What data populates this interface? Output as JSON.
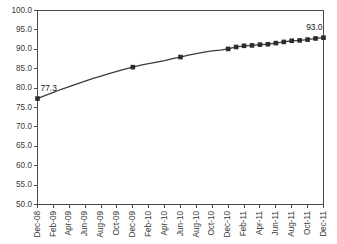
{
  "chart_data": {
    "type": "line",
    "title": "",
    "subtitle": "",
    "xlabel": "",
    "ylabel": "",
    "ylim": [
      50.0,
      100.0
    ],
    "ytick_step": 5.0,
    "ytick_labels": [
      "100.0",
      "95.0",
      "90.0",
      "85.0",
      "80.0",
      "75.0",
      "70.0",
      "65.0",
      "60.0",
      "55.0",
      "50.0"
    ],
    "ytick_values": [
      100.0,
      95.0,
      90.0,
      85.0,
      80.0,
      75.0,
      70.0,
      65.0,
      60.0,
      55.0,
      50.0
    ],
    "grid": false,
    "legend": false,
    "legend_position": "none",
    "x": [
      "Dec-08",
      "Jan-09",
      "Feb-09",
      "Mar-09",
      "Apr-09",
      "May-09",
      "Jun-09",
      "Jul-09",
      "Aug-09",
      "Sep-09",
      "Oct-09",
      "Nov-09",
      "Dec-09",
      "Jan-10",
      "Feb-10",
      "Mar-10",
      "Apr-10",
      "May-10",
      "Jun-10",
      "Jul-10",
      "Aug-10",
      "Sep-10",
      "Oct-10",
      "Nov-10",
      "Dec-10",
      "Jan-11",
      "Feb-11",
      "Mar-11",
      "Apr-11",
      "May-11",
      "Jun-11",
      "Jul-11",
      "Aug-11",
      "Sep-11",
      "Oct-11",
      "Nov-11",
      "Dec-11"
    ],
    "xtick_labels": [
      "Dec-08",
      "Feb-09",
      "Apr-09",
      "Jun-09",
      "Aug-09",
      "Oct-09",
      "Dec-09",
      "Feb-10",
      "Apr-10",
      "Jun-10",
      "Aug-10",
      "Oct-10",
      "Dec-10",
      "Feb-11",
      "Apr-11",
      "Jun-11",
      "Aug-11",
      "Oct-11",
      "Dec-11"
    ],
    "xtick_indices": [
      0,
      2,
      4,
      6,
      8,
      10,
      12,
      14,
      16,
      18,
      20,
      22,
      24,
      26,
      28,
      30,
      32,
      34,
      36
    ],
    "values": [
      77.3,
      78.1,
      78.9,
      79.7,
      80.4,
      81.1,
      81.8,
      82.5,
      83.1,
      83.7,
      84.3,
      84.9,
      85.4,
      85.9,
      86.3,
      86.7,
      87.1,
      87.6,
      88.0,
      88.5,
      88.9,
      89.3,
      89.6,
      89.8,
      90.1,
      90.6,
      90.9,
      91.0,
      91.2,
      91.3,
      91.6,
      91.9,
      92.2,
      92.3,
      92.5,
      92.8,
      93.0
    ],
    "marker_indices": [
      0,
      12,
      18,
      24,
      25,
      26,
      27,
      28,
      29,
      30,
      31,
      32,
      33,
      34,
      35,
      36
    ],
    "annotations": [
      {
        "name": "first-point-label",
        "text": "77.3",
        "index": 0,
        "value": 77.3
      },
      {
        "name": "last-point-label",
        "text": "93.0",
        "index": 36,
        "value": 93.0
      }
    ],
    "colors": {
      "line": "#3c3c3c",
      "marker": "#2b2b2b",
      "axis": "#4a4a4a",
      "text": "#3a3a3a",
      "background": "#ffffff"
    }
  }
}
